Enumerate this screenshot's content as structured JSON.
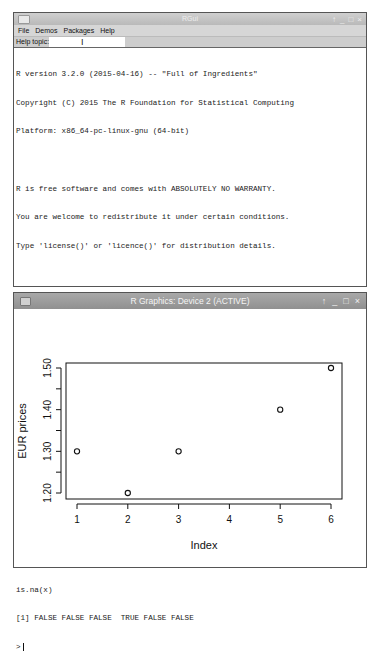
{
  "console_window": {
    "title": "RGui",
    "window_controls": [
      "pin",
      "minimize",
      "maximize",
      "close"
    ],
    "menu": [
      "File",
      "Demos",
      "Packages",
      "Help"
    ],
    "help_topic": {
      "label": "Help topic:",
      "value": ""
    },
    "lines": [
      "R version 3.2.0 (2015-04-16) -- \"Full of Ingredients\"",
      "Copyright (C) 2015 The R Foundation for Statistical Computing",
      "Platform: x86_64-pc-linux-gnu (64-bit)",
      "",
      "R is free software and comes with ABSOLUTELY NO WARRANTY.",
      "You are welcome to redistribute it under certain conditions.",
      "Type 'license()' or 'licence()' for distribution details.",
      "",
      "R is a collaborative project with many contributors.",
      "Type 'contributors()' for more information and",
      "'citation()' on how to cite R or R packages in publications.",
      "",
      "Type 'demo()' for some demos, 'help()' for on-line help, or",
      "'help.start()' for an HTML browser interface to help.",
      "Type 'q()' to quit R.",
      "",
      "> x = c(1.3,1.2,1.3,NA,1.4,1.5)",
      "plot(x,ylab=\"EUR prices\")",
      "is.na(x)",
      "[1] FALSE FALSE FALSE  TRUE FALSE FALSE"
    ],
    "prompt": ">"
  },
  "graphics_window": {
    "title": "R Graphics: Device 2 (ACTIVE)",
    "window_controls": [
      "pin",
      "minimize",
      "maximize",
      "close"
    ]
  },
  "chart_data": {
    "type": "scatter",
    "title": "",
    "xlabel": "Index",
    "ylabel": "EUR prices",
    "x": [
      1,
      2,
      3,
      4,
      5,
      6
    ],
    "values": [
      1.3,
      1.2,
      1.3,
      null,
      1.4,
      1.5
    ],
    "x_ticks": [
      "1",
      "2",
      "3",
      "4",
      "5",
      "6"
    ],
    "y_ticks": [
      "1.20",
      "1.30",
      "1.40",
      "1.50"
    ],
    "y_minor_ticks": [
      1.25,
      1.35,
      1.45
    ],
    "xlim": [
      1,
      6
    ],
    "ylim": [
      1.2,
      1.5
    ],
    "marker": "open-circle",
    "grid": false,
    "legend": null
  },
  "icons": {
    "pin": "↑",
    "minimize": "_",
    "maximize": "□",
    "close": "×",
    "text_cursor": "I"
  }
}
